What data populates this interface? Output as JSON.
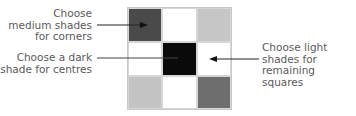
{
  "grid": {
    "rows": 3,
    "cols": 3,
    "cells": [
      {
        "shade": "medium",
        "color": "#4a4a4a"
      },
      {
        "shade": "white",
        "color": "#ffffff"
      },
      {
        "shade": "light",
        "color": "#c6c6c6"
      },
      {
        "shade": "white",
        "color": "#ffffff"
      },
      {
        "shade": "dark",
        "color": "#0a0a0a"
      },
      {
        "shade": "white",
        "color": "#ffffff"
      },
      {
        "shade": "light",
        "color": "#c4c4c4"
      },
      {
        "shade": "white",
        "color": "#ffffff"
      },
      {
        "shade": "medium",
        "color": "#6e6e6e"
      }
    ]
  },
  "annotations": {
    "corners": {
      "lines": [
        "Choose",
        "medium shades",
        "for corners"
      ]
    },
    "centres": {
      "lines": [
        "Choose a dark",
        "shade for centres"
      ]
    },
    "remaining": {
      "lines": [
        "Choose light",
        "shades for",
        "remaining squares"
      ]
    }
  },
  "colors": {
    "text": "#5a5a5a",
    "arrow": "#333333"
  }
}
